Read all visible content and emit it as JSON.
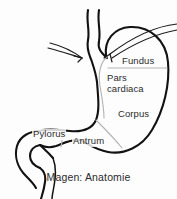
{
  "figure": {
    "caption": "Magen: Anatomie",
    "title": "Magen: Anatomie",
    "colors": {
      "background": "#fdfdfd",
      "outline": "#121212",
      "divider": "#b3b3b3",
      "text": "#2b2b2b"
    }
  },
  "labels": {
    "fundus": "Fundus",
    "pars_cardiaca_line1": "Pars",
    "pars_cardiaca_line2": "cardiaca",
    "corpus": "Corpus",
    "antrum": "Antrum",
    "pylorus": "Pylorus"
  },
  "parts": [
    {
      "id": "fundus",
      "label": "Fundus"
    },
    {
      "id": "pars-cardiaca",
      "label": "Pars cardiaca"
    },
    {
      "id": "corpus",
      "label": "Corpus"
    },
    {
      "id": "antrum",
      "label": "Antrum"
    },
    {
      "id": "pylorus",
      "label": "Pylorus"
    }
  ],
  "annotations": {
    "arrow_left": "arrow pointing to cardia from left",
    "arrow_right": "arrow pointing to cardia from upper right"
  }
}
